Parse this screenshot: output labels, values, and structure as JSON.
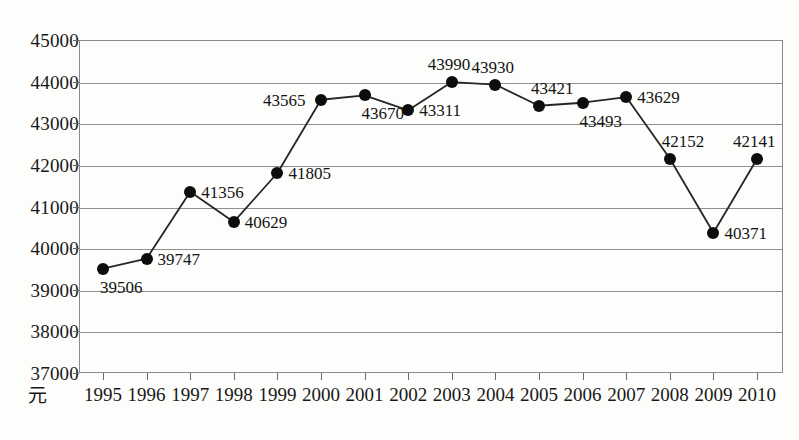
{
  "chart_data": {
    "type": "line",
    "title": "",
    "xlabel": "",
    "ylabel": "",
    "unit_label": "元",
    "grid": true,
    "legend": "none",
    "ylim": [
      37000,
      45000
    ],
    "ytick_step": 1000,
    "yticks": [
      "45000",
      "44000",
      "43000",
      "42000",
      "41000",
      "40000",
      "39000",
      "38000",
      "37000"
    ],
    "categories": [
      "1995",
      "1996",
      "1997",
      "1998",
      "1999",
      "2000",
      "2001",
      "2002",
      "2003",
      "2004",
      "2005",
      "2006",
      "2007",
      "2008",
      "2009",
      "2010"
    ],
    "values": [
      39506,
      39747,
      41356,
      40629,
      41805,
      43565,
      43670,
      43311,
      43990,
      43930,
      43421,
      43493,
      43629,
      42152,
      40371,
      42141
    ],
    "point_labels": [
      "39506",
      "39747",
      "41356",
      "40629",
      "41805",
      "43565",
      "43670",
      "43311",
      "43990",
      "43930",
      "43421",
      "43493",
      "43629",
      "42152",
      "40371",
      "42141"
    ],
    "label_positions": [
      "below-right",
      "right",
      "right",
      "right",
      "right",
      "left",
      "below-right",
      "right",
      "above",
      "above",
      "above-right",
      "below-right",
      "right",
      "above-right",
      "right",
      "above"
    ],
    "marker_color": "#0d0d0d",
    "line_color": "#262626",
    "grid_color": "#8f8f8f",
    "background_color": "#fdfdfb"
  }
}
